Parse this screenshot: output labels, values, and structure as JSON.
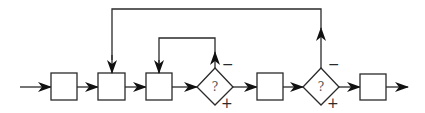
{
  "diagram": {
    "type": "flowchart",
    "colors": {
      "stroke": "#2a2a2a",
      "background": "#ffffff",
      "label": "#555555"
    },
    "boxes": [
      {
        "id": "box1",
        "x": 51,
        "y": 73,
        "w": 26,
        "h": 27
      },
      {
        "id": "box2",
        "x": 98,
        "y": 73,
        "w": 27,
        "h": 27
      },
      {
        "id": "box3",
        "x": 146,
        "y": 73,
        "w": 26,
        "h": 27
      },
      {
        "id": "box4",
        "x": 257,
        "y": 73,
        "w": 26,
        "h": 27
      },
      {
        "id": "box5",
        "x": 360,
        "y": 74,
        "w": 26,
        "h": 26
      }
    ],
    "decisions": [
      {
        "id": "decision1",
        "cx": 215,
        "cy": 87,
        "label": "?",
        "minus": "−",
        "plus": "+"
      },
      {
        "id": "decision2",
        "cx": 321,
        "cy": 87,
        "label": "?",
        "minus": "−",
        "plus": "+"
      }
    ]
  }
}
